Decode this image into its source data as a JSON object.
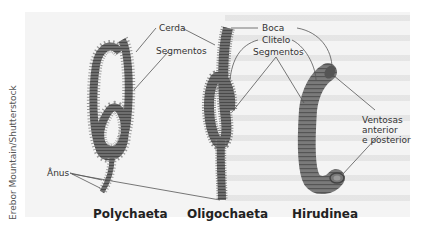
{
  "figure": {
    "credit": "Erebor Mountain/Shutterstock",
    "organisms": [
      {
        "name": "Polychaeta"
      },
      {
        "name": "Oligochaeta"
      },
      {
        "name": "Hirudinea"
      }
    ],
    "labels": {
      "cerda": "Cerda",
      "segmentos_left": "Segmentos",
      "anus": "Ânus",
      "boca": "Boca",
      "clitelo": "Clitelo",
      "segmentos_right": "Segmentos",
      "ventosas_line1": "Ventosas",
      "ventosas_line2": "anterior",
      "ventosas_line3": "e posterior"
    },
    "colors": {
      "background": "#f4f4f4",
      "worm_fill": "#6e6e6e",
      "worm_dark": "#4a4a4a",
      "leader_line": "#555555",
      "text": "#333333"
    }
  }
}
